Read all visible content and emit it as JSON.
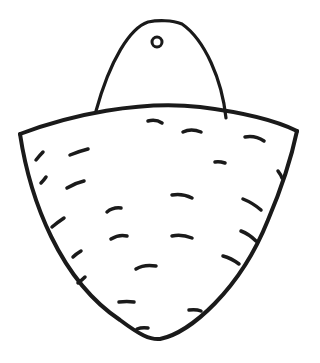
{
  "image": {
    "title": "Hand-drawn sketch of a hanging basket-shaped object",
    "stroke_color": "#1a1a1a",
    "background_color": "#ffffff"
  },
  "drawing": {
    "tag": {
      "description": "Arched hanging tag with a small hole near the top",
      "path": "M96 111 C 110 60, 130 28, 148 22 C 158 20, 172 20, 182 24 C 205 40, 222 80, 226 118",
      "hole": {
        "cx": 157,
        "cy": 42,
        "rx": 5,
        "ry": 5
      }
    },
    "basket": {
      "description": "Bowl/shield-shaped body with dash texture",
      "rim_path": "M20 134 C 70 115, 140 100, 200 107 C 240 112, 275 120, 297 131",
      "body_path": "M20 134 C 30 200, 60 280, 120 320 C 140 335, 150 340, 160 339 C 190 333, 240 290, 268 220 C 285 180, 293 150, 297 131"
    },
    "dashes": [
      "M148 121 q8 -2 14 2",
      "M183 132 q8 -4 18 0",
      "M245 137 q10 -2 19 4",
      "M36 160 q4 -5 7 -8",
      "M70 155 q10 -4 18 -6",
      "M215 162 q4 -1 10 1",
      "M278 171 q3 4 4 7",
      "M41 183 q3 -3 5 -6",
      "M67 188 q8 -5 17 -7",
      "M172 195 q10 -2 20 3",
      "M243 199 q10 4 18 11",
      "M107 212 q6 -5 14 -4",
      "M52 227 q6 -5 12 -9",
      "M111 239 q8 -5 16 -3",
      "M172 236 q10 -2 20 2",
      "M241 231 q8 3 15 10",
      "M73 257 q3 -3 8 -6",
      "M223 256 q8 2 16 8",
      "M136 269 q8 -5 20 -3",
      "M78 283 q4 -3 7 -6",
      "M119 302 q8 -1 15 0",
      "M189 310 q7 -1 12 1",
      "M137 329 q5 -2 11 -1"
    ]
  }
}
